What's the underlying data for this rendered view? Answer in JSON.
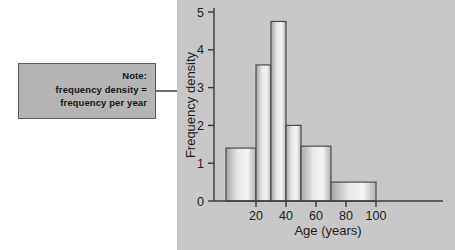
{
  "note": {
    "name": "note-callout",
    "lines": [
      "Note:",
      "frequency density =",
      "frequency per year"
    ],
    "box_color": "#b4b4b4",
    "border_color": "#5a5a5a",
    "arrow_icon": "arrow-right-icon"
  },
  "panel": {
    "background_color": "#c7c7c7"
  },
  "chart_data": {
    "type": "bar",
    "title": "",
    "xlabel": "Age (years)",
    "ylabel": "Frequency density",
    "xlim": [
      0,
      110
    ],
    "ylim": [
      0,
      5.2
    ],
    "grid": false,
    "legend": null,
    "xticks": [
      20,
      40,
      60,
      80,
      100
    ],
    "xtick_labels": [
      "20",
      "40",
      "60",
      "80",
      "100"
    ],
    "yticks": [
      0,
      1,
      2,
      3,
      4,
      5
    ],
    "ytick_labels": [
      "0",
      "1",
      "2",
      "3",
      "4",
      "5"
    ],
    "bin_edges": [
      0,
      20,
      30,
      40,
      50,
      70,
      100
    ],
    "values": [
      1.4,
      3.6,
      4.75,
      2.0,
      1.45,
      0.5
    ],
    "bins": [
      {
        "range": "0-20",
        "start": 0,
        "end": 20,
        "density": 1.4
      },
      {
        "range": "20-30",
        "start": 20,
        "end": 30,
        "density": 3.6
      },
      {
        "range": "30-40",
        "start": 30,
        "end": 40,
        "density": 4.75
      },
      {
        "range": "40-50",
        "start": 40,
        "end": 50,
        "density": 2.0
      },
      {
        "range": "50-70",
        "start": 50,
        "end": 70,
        "density": 1.45
      },
      {
        "range": "70-100",
        "start": 70,
        "end": 100,
        "density": 0.5
      }
    ],
    "bar_fill_light": "#f0f0f0",
    "bar_fill_dark": "#a8a8a8",
    "axis_color": "#3a3a3a"
  }
}
